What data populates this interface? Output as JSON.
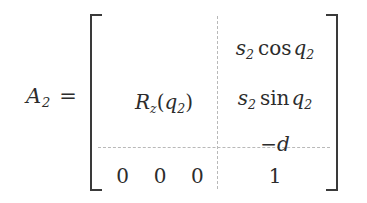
{
  "document": {
    "type": "math-equation",
    "background_color": "#ffffff",
    "text_color": "#2c2c2c",
    "rule_color": "#b9b9b9",
    "bracket_color": "#3a3a3a"
  },
  "equation": {
    "lhs": {
      "symbol": "A",
      "subscript": "2",
      "relation": "="
    },
    "matrix": {
      "delimiter_left": "[",
      "delimiter_right": "]",
      "partition_vertical": true,
      "partition_horizontal": true,
      "block_rotation": {
        "symbol": "R",
        "subscript": "z",
        "open_paren": "(",
        "argument": "q",
        "argument_subscript": "2",
        "close_paren": ")",
        "full_text": "R_z(q_2)"
      },
      "column4": [
        {
          "factor": "s",
          "factor_subscript": "2",
          "function": "cos",
          "argument": "q",
          "argument_subscript": "2",
          "full_text": "s_2 cos q_2"
        },
        {
          "factor": "s",
          "factor_subscript": "2",
          "function": "sin",
          "argument": "q",
          "argument_subscript": "2",
          "full_text": "s_2 sin q_2"
        },
        {
          "minus": "−",
          "argument": "d",
          "full_text": "−d"
        }
      ],
      "bottom_row": {
        "zeros": [
          "0",
          "0",
          "0"
        ],
        "one": "1"
      }
    }
  }
}
